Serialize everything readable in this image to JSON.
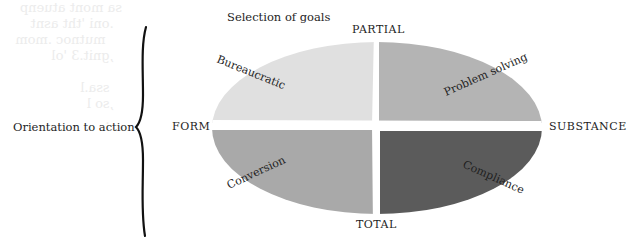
{
  "diagram": {
    "top_axis_title": "Selection of goals",
    "left_axis_title": "Orientation to action",
    "poles": {
      "top": "PARTIAL",
      "bottom": "TOTAL",
      "left": "FORM",
      "right": "SUBSTANCE"
    },
    "quadrants": [
      {
        "position": "top-left",
        "label": "Bureaucratic",
        "color": "#e0e0e0"
      },
      {
        "position": "top-right",
        "label": "Problem solving",
        "color": "#b4b4b4"
      },
      {
        "position": "bottom-left",
        "label": "Conversion",
        "color": "#a9a9a9"
      },
      {
        "position": "bottom-right",
        "label": "Compliance",
        "color": "#5b5b5b"
      }
    ],
    "bleed_through_text": "sa mont atuenp\n  .oni 'tht asnt\n    mutnoc .mom\n  ,gnit.3 'ol\n\n   ssa.l\n  ,so l\n   ."
  }
}
